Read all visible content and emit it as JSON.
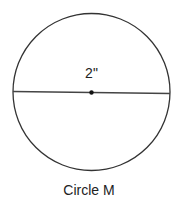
{
  "diagram": {
    "shape": "circle",
    "name": "Circle M",
    "diameter_label": "2\"",
    "has_center_point": true,
    "colors": {
      "stroke": "#333333",
      "text": "#222222",
      "background": "#ffffff"
    }
  }
}
